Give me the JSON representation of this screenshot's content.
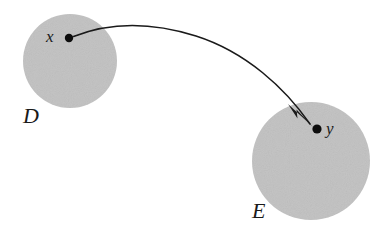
{
  "figure": {
    "type": "set-mapping-diagram",
    "width": 387,
    "height": 234,
    "background_color": "#ffffff",
    "set_fill_color": "#c4c4c4",
    "ink_color": "#1a1a1a"
  },
  "sets": [
    {
      "id": "D",
      "label": "D",
      "cx": 70,
      "cy": 61,
      "r": 47,
      "label_x": 23,
      "label_y": 105
    },
    {
      "id": "E",
      "label": "E",
      "cx": 311,
      "cy": 161,
      "r": 59,
      "label_x": 252,
      "label_y": 200
    }
  ],
  "points": [
    {
      "id": "x",
      "label": "x",
      "cx": 69,
      "cy": 38,
      "r": 4.2,
      "in_set": "D",
      "label_x": 46,
      "label_y": 28
    },
    {
      "id": "y",
      "label": "y",
      "cx": 317,
      "cy": 129,
      "r": 4.6,
      "in_set": "E",
      "label_x": 326,
      "label_y": 120
    }
  ],
  "arrow": {
    "from_point": "x",
    "to_point": "y",
    "path": "M 73.5 36.5 C 110 22 150 21.5 196 36 C 246 52 285 88 310 124",
    "stroke_width": 1.6,
    "head": "M 310.5 125.5 L 290.5 106.5 L 297.5 118.0 L 297.2 111.0 Z",
    "head_polygon": "313,127 288,104 297.5,118.5 296.5,109.5"
  },
  "chart_data": {
    "type": "diagram",
    "title": "",
    "nodes": [
      {
        "name": "D",
        "kind": "set"
      },
      {
        "name": "E",
        "kind": "set"
      },
      {
        "name": "x",
        "kind": "element",
        "member_of": "D"
      },
      {
        "name": "y",
        "kind": "element",
        "member_of": "E"
      }
    ],
    "edges": [
      {
        "from": "x",
        "to": "y",
        "kind": "curved-arrow"
      }
    ]
  }
}
